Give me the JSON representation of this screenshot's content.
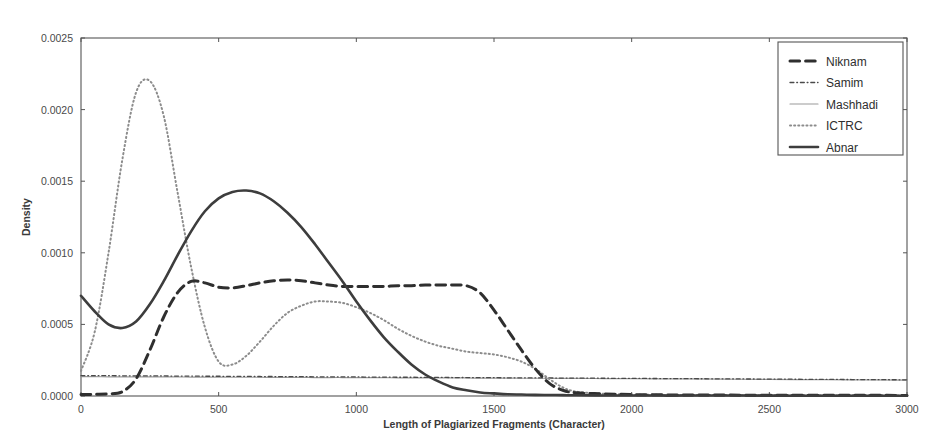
{
  "chart_data": {
    "type": "line",
    "title": "",
    "xlabel": "Length of Plagiarized Fragments (Character)",
    "ylabel": "Density",
    "xlim": [
      0,
      3000
    ],
    "ylim": [
      0.0,
      0.0025
    ],
    "xticks": [
      0,
      500,
      1000,
      1500,
      2000,
      2500,
      3000
    ],
    "xtick_labels": [
      "0",
      "500",
      "1000",
      "1500",
      "2000",
      "2500",
      "3000"
    ],
    "yticks": [
      0.0,
      0.0005,
      0.001,
      0.0015,
      0.002,
      0.0025
    ],
    "ytick_labels": [
      "0.0000",
      "0.0005",
      "0.0010",
      "0.0015",
      "0.0020",
      "0.0025"
    ],
    "grid": false,
    "legend_position": "upper right",
    "legend_entries": [
      "Niknam",
      "Samim",
      "Mashhadi",
      "ICTRC",
      "Abnar"
    ],
    "x": [
      0,
      50,
      100,
      150,
      200,
      250,
      300,
      350,
      400,
      450,
      500,
      550,
      600,
      650,
      700,
      750,
      800,
      850,
      900,
      950,
      1000,
      1050,
      1100,
      1150,
      1200,
      1250,
      1300,
      1350,
      1400,
      1450,
      1500,
      1550,
      1600,
      1650,
      1700,
      1750,
      1800,
      1900,
      2000,
      2100,
      2200,
      2400,
      2600,
      2800,
      3000
    ],
    "series": [
      {
        "name": "Niknam",
        "style": "dashed",
        "color": "#2f2f2f",
        "width": 3.0,
        "values": [
          1e-05,
          1.2e-05,
          1.5e-05,
          3e-05,
          0.00012,
          0.00032,
          0.00055,
          0.00072,
          0.0008,
          0.00079,
          0.00076,
          0.000755,
          0.00077,
          0.00079,
          0.000805,
          0.00081,
          0.000805,
          0.00079,
          0.000775,
          0.000765,
          0.000765,
          0.000765,
          0.000765,
          0.00077,
          0.00077,
          0.000775,
          0.000775,
          0.000775,
          0.00077,
          0.00072,
          0.0006,
          0.00046,
          0.00032,
          0.00019,
          9e-05,
          4e-05,
          2.2e-05,
          1.5e-05,
          1e-05,
          8e-06,
          7e-06,
          6e-06,
          5e-06,
          5e-06,
          4e-06
        ]
      },
      {
        "name": "Samim",
        "style": "dashdot",
        "color": "#4a4a4a",
        "width": 1.3,
        "values": [
          0.000142,
          0.000142,
          0.000142,
          0.000141,
          0.000141,
          0.00014,
          0.00014,
          0.000139,
          0.000139,
          0.000138,
          0.000138,
          0.000137,
          0.000137,
          0.000136,
          0.000136,
          0.000135,
          0.000135,
          0.000134,
          0.000134,
          0.000133,
          0.000133,
          0.000132,
          0.000132,
          0.000131,
          0.000131,
          0.00013,
          0.00013,
          0.000129,
          0.000129,
          0.000128,
          0.000128,
          0.000127,
          0.000127,
          0.000126,
          0.000126,
          0.000125,
          0.000125,
          0.000124,
          0.000123,
          0.000122,
          0.000121,
          0.000119,
          0.000117,
          0.000115,
          0.000113
        ]
      },
      {
        "name": "Mashhadi",
        "style": "solid",
        "color": "#9a9a9a",
        "width": 1.2,
        "values": [
          0.000135,
          0.000135,
          0.000134,
          0.000134,
          0.000134,
          0.000133,
          0.000133,
          0.000133,
          0.000132,
          0.000132,
          0.000132,
          0.000131,
          0.000131,
          0.000131,
          0.00013,
          0.00013,
          0.00013,
          0.000129,
          0.000129,
          0.000129,
          0.000128,
          0.000128,
          0.000128,
          0.000127,
          0.000127,
          0.000127,
          0.000126,
          0.000126,
          0.000126,
          0.000125,
          0.000125,
          0.000125,
          0.000124,
          0.000124,
          0.000124,
          0.000123,
          0.000123,
          0.000122,
          0.000121,
          0.00012,
          0.000119,
          0.000117,
          0.000115,
          0.000113,
          0.000111
        ]
      },
      {
        "name": "ICTRC",
        "style": "dotted",
        "color": "#8c8c8c",
        "width": 2.0,
        "values": [
          0.000175,
          0.00045,
          0.001,
          0.00165,
          0.00212,
          0.0022,
          0.00196,
          0.00143,
          0.0009,
          0.00048,
          0.00024,
          0.00022,
          0.00028,
          0.00038,
          0.00049,
          0.00058,
          0.00063,
          0.00066,
          0.00066,
          0.00065,
          0.00062,
          0.00058,
          0.00053,
          0.00047,
          0.00042,
          0.00038,
          0.00035,
          0.00033,
          0.00031,
          0.0003,
          0.00029,
          0.00027,
          0.00024,
          0.00019,
          0.00012,
          6e-05,
          3e-05,
          1.5e-05,
          1e-05,
          8e-06,
          7e-06,
          6e-06,
          5e-06,
          5e-06,
          4e-06
        ]
      },
      {
        "name": "Abnar",
        "style": "solid",
        "color": "#3d3d3d",
        "width": 2.6,
        "values": [
          0.0007,
          0.00059,
          0.0005,
          0.000475,
          0.00052,
          0.00064,
          0.0008,
          0.00098,
          0.00115,
          0.00129,
          0.00138,
          0.001425,
          0.001435,
          0.001415,
          0.00136,
          0.00128,
          0.00118,
          0.00106,
          0.00093,
          0.0008,
          0.00066,
          0.00053,
          0.00041,
          0.00031,
          0.00022,
          0.00015,
          0.0001,
          6e-05,
          4e-05,
          2.5e-05,
          1.8e-05,
          1.2e-05,
          1e-05,
          8e-06,
          7e-06,
          6e-06,
          5e-06,
          4e-06,
          4e-06,
          3e-06,
          3e-06,
          3e-06,
          2e-06,
          2e-06,
          2e-06
        ]
      }
    ]
  }
}
